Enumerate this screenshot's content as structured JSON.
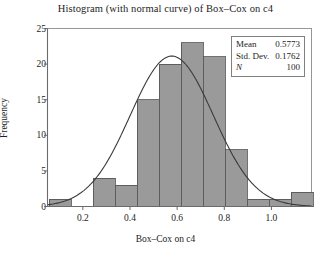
{
  "chart_data": {
    "type": "bar",
    "title": "Histogram (with normal curve) of Box–Cox on c4",
    "xlabel": "Box–Cox on c4",
    "ylabel": "Frequency",
    "xlim": [
      0.05,
      1.17
    ],
    "ylim": [
      0,
      25
    ],
    "grid": false,
    "legend_position": "top-right",
    "bin_width": 0.0933,
    "bin_edges": [
      0.0567,
      0.15,
      0.2433,
      0.3367,
      0.43,
      0.5233,
      0.6167,
      0.71,
      0.8033,
      0.8967,
      0.99,
      1.0833,
      1.1767
    ],
    "categories": [
      "0.06–0.15",
      "0.15–0.24",
      "0.24–0.34",
      "0.34–0.43",
      "0.43–0.52",
      "0.52–0.62",
      "0.62–0.71",
      "0.71–0.80",
      "0.80–0.90",
      "0.90–0.99",
      "0.99–1.08",
      "1.08–1.18"
    ],
    "values": [
      1,
      0,
      4,
      3,
      15,
      20,
      23,
      21,
      8,
      1,
      1,
      2
    ],
    "xticks": [
      0.2,
      0.4,
      0.6,
      0.8,
      1.0
    ],
    "xtick_labels": [
      "0.2",
      "0.4",
      "0.6",
      "0.8",
      "1.0"
    ],
    "yticks": [
      0,
      5,
      10,
      15,
      20,
      25
    ],
    "ytick_labels": [
      "0",
      "5",
      "10",
      "15",
      "20",
      "25"
    ],
    "series": [
      {
        "name": "Histogram",
        "type": "bar",
        "values": [
          1,
          0,
          4,
          3,
          15,
          20,
          23,
          21,
          8,
          1,
          1,
          2
        ]
      },
      {
        "name": "Normal curve",
        "type": "line",
        "mean": 0.5773,
        "std": 0.1762,
        "n": 100,
        "peak_value": 22.6
      }
    ],
    "bar_fill_color": "#9a9a9a",
    "bar_edge_color": "#4d4d4d",
    "curve_color": "#3a3a3a",
    "axis_color": "#6b6b6b"
  },
  "stats_box": {
    "mean_label": "Mean",
    "mean_value": "0.5773",
    "std_label": "Std. Dev.",
    "std_value": "0.1762",
    "n_label": "N",
    "n_value": "100"
  }
}
